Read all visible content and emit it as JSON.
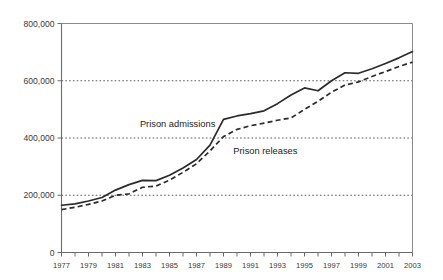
{
  "chart_data": {
    "type": "line",
    "title": "",
    "subtitle": "",
    "xlabel": "",
    "ylabel": "",
    "xlim": [
      1977,
      2003
    ],
    "ylim": [
      0,
      800000
    ],
    "grid": true,
    "gridlines_y": [
      200000,
      400000,
      600000
    ],
    "legend_position": "inline-annotation",
    "y_ticks": [
      0,
      200000,
      400000,
      600000,
      800000
    ],
    "y_tick_labels": [
      "0",
      "200,000",
      "400,000",
      "600,000",
      "800,000"
    ],
    "x_ticks": [
      1977,
      1978,
      1979,
      1980,
      1981,
      1982,
      1983,
      1984,
      1985,
      1986,
      1987,
      1988,
      1989,
      1990,
      1991,
      1992,
      1993,
      1994,
      1995,
      1996,
      1997,
      1998,
      1999,
      2000,
      2001,
      2002,
      2003
    ],
    "x_tick_labels_shown": [
      "1977",
      "1979",
      "1981",
      "1983",
      "1985",
      "1987",
      "1989",
      "1991",
      "1993",
      "1995",
      "1997",
      "1999",
      "2001",
      "2003"
    ],
    "x": [
      1977,
      1978,
      1979,
      1980,
      1981,
      1982,
      1983,
      1984,
      1985,
      1986,
      1987,
      1988,
      1989,
      1990,
      1991,
      1992,
      1993,
      1994,
      1995,
      1996,
      1997,
      1998,
      1999,
      2000,
      2001,
      2002,
      2003
    ],
    "series": [
      {
        "name": "Prison admissions",
        "style": "solid",
        "color": "#2b2b2b",
        "annotation": "Prison admissions",
        "values": [
          165000,
          170000,
          180000,
          192000,
          218000,
          237000,
          252000,
          251000,
          270000,
          295000,
          325000,
          375000,
          465000,
          477000,
          485000,
          495000,
          520000,
          550000,
          575000,
          565000,
          600000,
          628000,
          626000,
          642000,
          660000,
          680000,
          702000
        ]
      },
      {
        "name": "Prison releases",
        "style": "dashed",
        "color": "#2b2b2b",
        "annotation": "Prison releases",
        "values": [
          150000,
          158000,
          168000,
          180000,
          200000,
          205000,
          228000,
          232000,
          253000,
          280000,
          310000,
          355000,
          405000,
          430000,
          443000,
          452000,
          462000,
          470000,
          500000,
          528000,
          560000,
          585000,
          596000,
          615000,
          632000,
          650000,
          665000
        ]
      }
    ],
    "annotations": [
      {
        "text": "Prison admissions",
        "x": 1985.6,
        "y": 440000
      },
      {
        "text": "Prison releases",
        "x": 1992.1,
        "y": 345000
      }
    ]
  }
}
